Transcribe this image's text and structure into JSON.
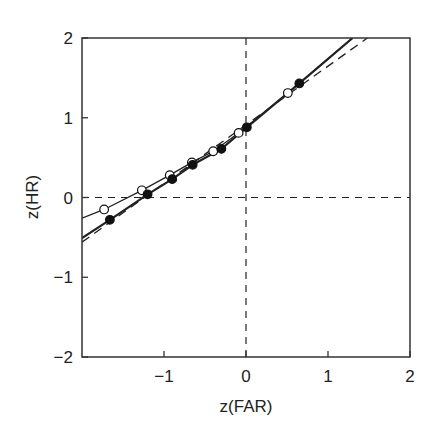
{
  "chart_data": {
    "type": "line",
    "title": "",
    "xlabel": "z(FAR)",
    "ylabel": "z(HR)",
    "xlim": [
      -2,
      2
    ],
    "ylim": [
      -2,
      2
    ],
    "xticks": [
      -1,
      0,
      1,
      2
    ],
    "xtick_labels": [
      "−1",
      "0",
      "1",
      "2"
    ],
    "yticks": [
      -2,
      -1,
      0,
      1,
      2
    ],
    "ytick_labels": [
      "−2",
      "−1",
      "0",
      "1",
      "2"
    ],
    "grid": false,
    "reference_lines": [
      {
        "orientation": "horizontal",
        "value": 0,
        "style": "dashed"
      },
      {
        "orientation": "vertical",
        "value": 0,
        "style": "dashed"
      }
    ],
    "series": [
      {
        "name": "open-circles",
        "marker": "open-circle",
        "points": [
          [
            -1.73,
            -0.15
          ],
          [
            -1.27,
            0.09
          ],
          [
            -0.93,
            0.28
          ],
          [
            -0.66,
            0.44
          ],
          [
            -0.4,
            0.58
          ],
          [
            -0.09,
            0.81
          ],
          [
            0.51,
            1.31
          ]
        ],
        "fit_line": {
          "style": "solid-thin",
          "points": [
            [
              -2,
              -0.26
            ],
            [
              -1.73,
              -0.15
            ],
            [
              -1.27,
              0.09
            ],
            [
              -0.93,
              0.28
            ],
            [
              -0.66,
              0.44
            ],
            [
              -0.4,
              0.58
            ],
            [
              -0.09,
              0.81
            ],
            [
              0.51,
              1.31
            ],
            [
              1.3,
              2.0
            ]
          ]
        }
      },
      {
        "name": "filled-circles",
        "marker": "filled-circle",
        "points": [
          [
            -1.66,
            -0.28
          ],
          [
            -1.2,
            0.04
          ],
          [
            -0.9,
            0.23
          ],
          [
            -0.65,
            0.41
          ],
          [
            -0.3,
            0.61
          ],
          [
            0.01,
            0.88
          ],
          [
            0.65,
            1.43
          ]
        ],
        "fit_line": {
          "style": "solid-thick",
          "points": [
            [
              -2,
              -0.51
            ],
            [
              -1.66,
              -0.28
            ],
            [
              -1.2,
              0.04
            ],
            [
              -0.9,
              0.23
            ],
            [
              -0.65,
              0.41
            ],
            [
              -0.3,
              0.61
            ],
            [
              0.01,
              0.88
            ],
            [
              0.65,
              1.43
            ],
            [
              1.3,
              2.0
            ]
          ]
        }
      },
      {
        "name": "linear-fit",
        "marker": "none",
        "style": "dashed",
        "points": [
          [
            -2,
            -0.56
          ],
          [
            1.48,
            2.0
          ]
        ]
      }
    ]
  }
}
